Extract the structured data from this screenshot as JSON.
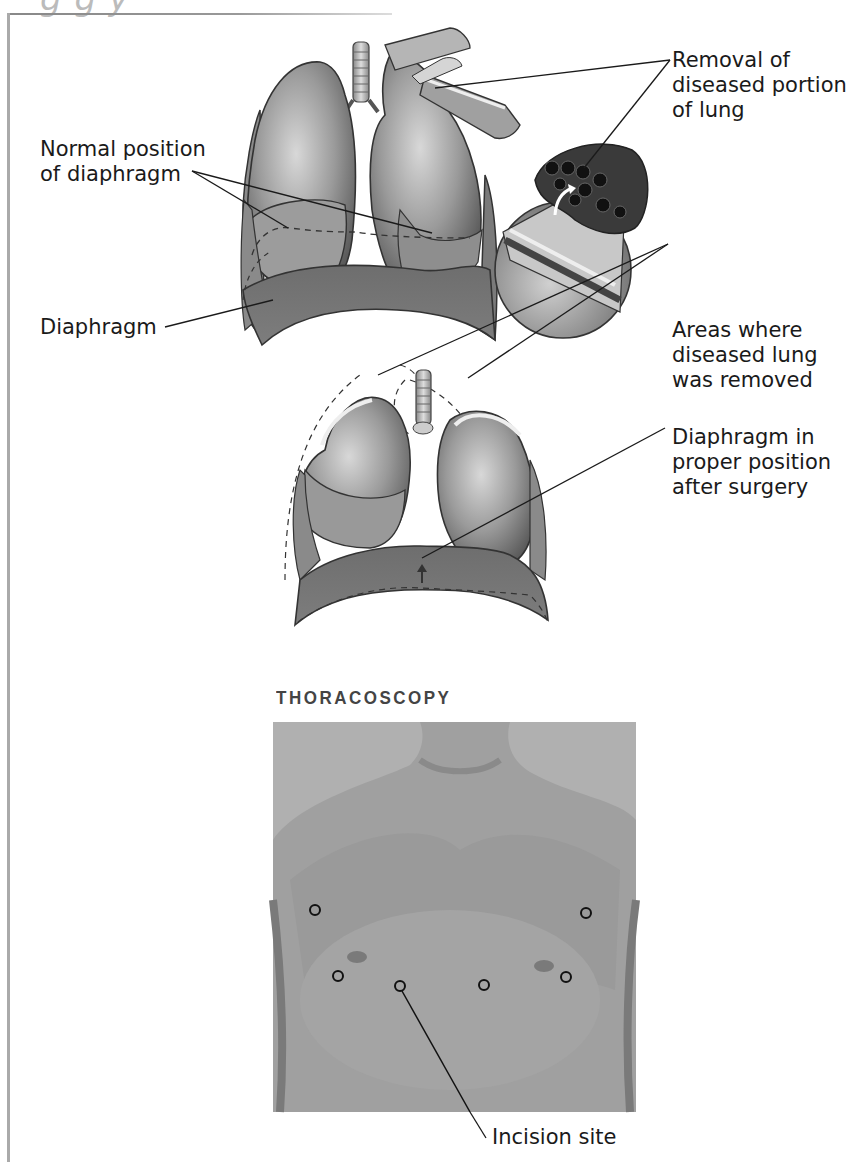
{
  "figure": {
    "cut_off_title": "g                         g   y",
    "upper_diagram": {
      "labels": {
        "normal_position": [
          "Normal position",
          "of diaphragm"
        ],
        "diaphragm": "Diaphragm",
        "removal": [
          "Removal of",
          "diseased portion",
          "of lung"
        ]
      }
    },
    "lower_diagram": {
      "labels": {
        "areas_removed": [
          "Areas where",
          "diseased lung",
          "was removed"
        ],
        "diaphragm_proper": [
          "Diaphragm in",
          "proper position",
          "after surgery"
        ]
      }
    },
    "thoracoscopy": {
      "title": "THORACOSCOPY",
      "incision_label": "Incision site",
      "incision_marker_count": 7
    }
  }
}
